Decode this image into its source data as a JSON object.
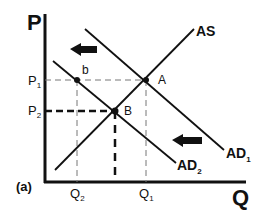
{
  "diagram": {
    "panel_label": "(a)",
    "axes": {
      "y_label": "P",
      "x_label": "Q"
    },
    "price_levels": [
      {
        "label": "P",
        "subscript": "1"
      },
      {
        "label": "P",
        "subscript": "2"
      }
    ],
    "quantity_levels": [
      {
        "label": "Q",
        "subscript": "2"
      },
      {
        "label": "Q",
        "subscript": "1"
      }
    ],
    "curves": {
      "as": {
        "label": "AS"
      },
      "ad1": {
        "label": "AD",
        "subscript": "1"
      },
      "ad2": {
        "label": "AD",
        "subscript": "2"
      }
    },
    "points": {
      "A": {
        "label": "A"
      },
      "B": {
        "label": "B"
      },
      "b": {
        "label": "b"
      }
    },
    "arrows": [
      {
        "direction": "left",
        "meaning": "shift-left"
      },
      {
        "direction": "left",
        "meaning": "shift-left"
      }
    ],
    "colors": {
      "ink": "#111111",
      "background": "#ffffff",
      "guide": "#888888"
    }
  }
}
